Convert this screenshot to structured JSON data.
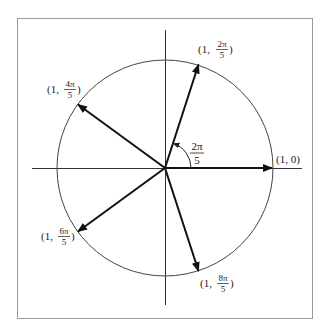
{
  "diagram": {
    "type": "unit-circle-vectors",
    "center": [
      165,
      168
    ],
    "radius": 108,
    "colors": {
      "frame": "#9a9a9a",
      "axis": "#333333",
      "circle": "#444444",
      "vector": "#111111",
      "text": "#222222"
    },
    "angle_annotation": {
      "label_num": "2π",
      "label_den": "5"
    },
    "vectors": [
      {
        "angle_deg": 0,
        "prefix": "(1, ",
        "value": "0",
        "suffix": ")",
        "fraction": false
      },
      {
        "angle_deg": 72,
        "prefix": "(1, ",
        "num": "2π",
        "den": "5",
        "suffix": ")",
        "fraction": true
      },
      {
        "angle_deg": 144,
        "prefix": "(1, ",
        "num": "4π",
        "den": "5",
        "suffix": ")",
        "fraction": true
      },
      {
        "angle_deg": 216,
        "prefix": "(1, ",
        "num": "6π",
        "den": "5",
        "suffix": ")",
        "fraction": true
      },
      {
        "angle_deg": 288,
        "prefix": "(1, ",
        "num": "8π",
        "den": "5",
        "suffix": ")",
        "fraction": true
      }
    ]
  }
}
